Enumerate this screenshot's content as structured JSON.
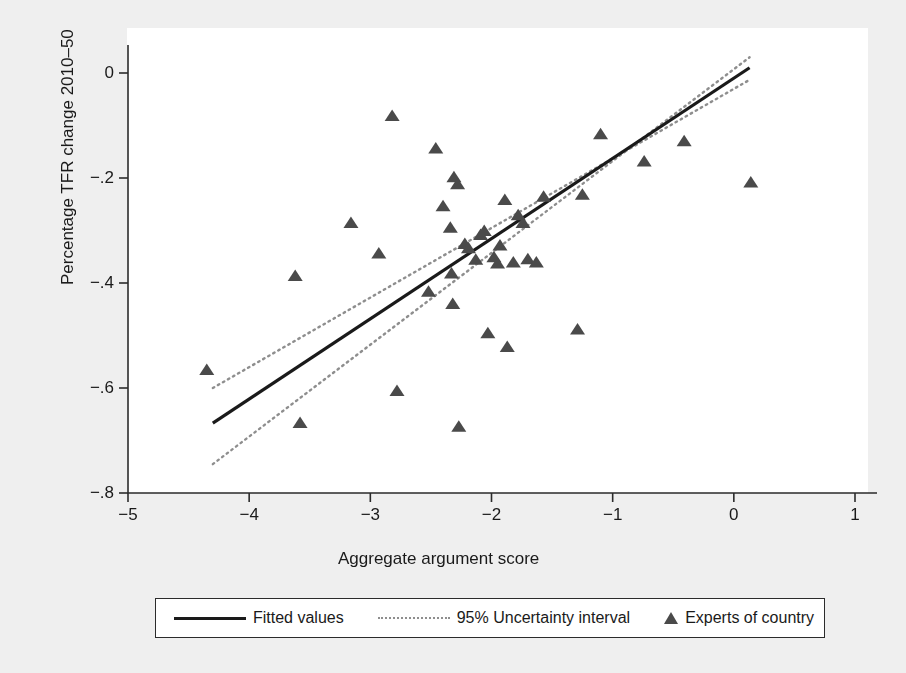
{
  "figure": {
    "background_color": "#efefef",
    "plot_background_color": "#ffffff"
  },
  "axes": {
    "x_title": "Aggregate argument score",
    "y_title": "Percentage TFR change 2010–50",
    "x_ticks": [
      "-5",
      "-4",
      "-3",
      "-2",
      "-1",
      "0",
      "1"
    ],
    "y_ticks": [
      "0",
      "-.2",
      "-.4",
      "-.6",
      "-.8"
    ]
  },
  "legend": {
    "fitted_label": "Fitted values",
    "interval_label": "95% Uncertainty interval",
    "points_label": "Experts of country"
  },
  "chart_data": {
    "type": "scatter",
    "title": "",
    "xlabel": "Aggregate argument score",
    "ylabel": "Percentage TFR change 2010–50",
    "xlim": [
      -5,
      1
    ],
    "ylim": [
      -0.8,
      0.02
    ],
    "xticks": [
      -5,
      -4,
      -3,
      -2,
      -1,
      0,
      1
    ],
    "yticks": [
      0,
      -0.2,
      -0.4,
      -0.6,
      -0.8
    ],
    "grid": false,
    "legend_position": "below-axes",
    "marker": "triangle",
    "marker_color": "#4a4a4a",
    "series": [
      {
        "name": "Experts of country",
        "type": "scatter",
        "points": [
          [
            -4.35,
            -0.567
          ],
          [
            -3.62,
            -0.388
          ],
          [
            -3.58,
            -0.668
          ],
          [
            -3.16,
            -0.287
          ],
          [
            -2.93,
            -0.345
          ],
          [
            -2.82,
            -0.083
          ],
          [
            -2.78,
            -0.607
          ],
          [
            -2.52,
            -0.418
          ],
          [
            -2.46,
            -0.145
          ],
          [
            -2.4,
            -0.255
          ],
          [
            -2.34,
            -0.296
          ],
          [
            -2.33,
            -0.383
          ],
          [
            -2.32,
            -0.441
          ],
          [
            -2.31,
            -0.2
          ],
          [
            -2.28,
            -0.213
          ],
          [
            -2.27,
            -0.675
          ],
          [
            -2.22,
            -0.327
          ],
          [
            -2.19,
            -0.335
          ],
          [
            -2.13,
            -0.357
          ],
          [
            -2.09,
            -0.31
          ],
          [
            -2.06,
            -0.302
          ],
          [
            -2.03,
            -0.497
          ],
          [
            -1.98,
            -0.352
          ],
          [
            -1.95,
            -0.364
          ],
          [
            -1.93,
            -0.33
          ],
          [
            -1.89,
            -0.243
          ],
          [
            -1.87,
            -0.523
          ],
          [
            -1.82,
            -0.362
          ],
          [
            -1.78,
            -0.272
          ],
          [
            -1.74,
            -0.287
          ],
          [
            -1.7,
            -0.356
          ],
          [
            -1.63,
            -0.362
          ],
          [
            -1.57,
            -0.237
          ],
          [
            -1.29,
            -0.49
          ],
          [
            -1.25,
            -0.233
          ],
          [
            -1.1,
            -0.118
          ],
          [
            -0.74,
            -0.17
          ],
          [
            -0.41,
            -0.131
          ],
          [
            0.14,
            -0.21
          ]
        ]
      },
      {
        "name": "Fitted values",
        "type": "line",
        "style": "solid",
        "color": "#1a1a1a",
        "x": [
          -4.3,
          0.13
        ],
        "y": [
          -0.667,
          0.01
        ]
      },
      {
        "name": "95% Uncertainty interval upper",
        "type": "line",
        "style": "dotted",
        "color": "#8e8e8e",
        "x": [
          -4.3,
          0.13
        ],
        "y": [
          -0.6,
          -0.013
        ]
      },
      {
        "name": "95% Uncertainty interval lower",
        "type": "line",
        "style": "dotted",
        "color": "#8e8e8e",
        "x": [
          -4.3,
          0.13
        ],
        "y": [
          -0.745,
          0.03
        ]
      }
    ]
  }
}
